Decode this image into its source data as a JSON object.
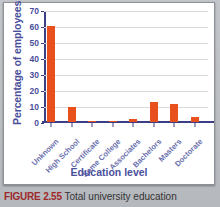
{
  "chart_data": {
    "type": "bar",
    "title": "",
    "xlabel": "Education level",
    "ylabel": "Percentage of employees",
    "categories": [
      "Unknown",
      "High School",
      "Certificate",
      "Some College",
      "Associates",
      "Bachelors",
      "Masters",
      "Doctorate"
    ],
    "values": [
      60,
      9.5,
      0.6,
      0.2,
      1.8,
      12.3,
      11.3,
      3
    ],
    "ylim": [
      0,
      70
    ],
    "yticks": [
      0,
      10,
      20,
      30,
      40,
      50,
      60,
      70
    ],
    "ytick_labels": [
      "0",
      "10",
      "20",
      "30",
      "40",
      "50",
      "60",
      "70"
    ],
    "grid": true,
    "legend": "none",
    "series": [
      {
        "name": "Percentage of employees",
        "values": [
          60,
          9.5,
          0.6,
          0.2,
          1.8,
          12.3,
          11.3,
          3
        ]
      }
    ],
    "colors": {
      "bar": "#e8501e",
      "axis": "#3d3f86",
      "axis_text": "#4a4f9b",
      "tick_text": "#6b70ad",
      "gridline": "#d9d9de",
      "panel_background": "#ffffff",
      "page_background": "#b9bcc0"
    }
  },
  "caption": {
    "figure_number": "FIGURE 2.55",
    "text": "Total university education"
  }
}
